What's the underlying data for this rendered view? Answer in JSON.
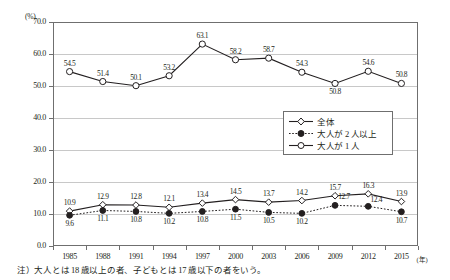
{
  "chart_data": {
    "type": "line",
    "title": "",
    "xlabel": "年",
    "ylabel": "(%)",
    "unit_label": "(%)",
    "xaxis_unit_label": "(年)",
    "ylim": [
      0.0,
      70.0
    ],
    "ytick_labels": [
      "0.0",
      "10.0",
      "20.0",
      "30.0",
      "40.0",
      "50.0",
      "60.0",
      "70.0"
    ],
    "ytick_values": [
      0.0,
      10.0,
      20.0,
      30.0,
      40.0,
      50.0,
      60.0,
      70.0
    ],
    "grid": true,
    "legend_position": "inside-right-middle",
    "categories": [
      "1985",
      "1988",
      "1991",
      "1994",
      "1997",
      "2000",
      "2003",
      "2006",
      "2009",
      "2012",
      "2015"
    ],
    "x": [
      1985,
      1988,
      1991,
      1994,
      1997,
      2000,
      2003,
      2006,
      2009,
      2012,
      2015
    ],
    "series": [
      {
        "name": "全体",
        "marker": "open-diamond",
        "linestyle": "solid",
        "values": [
          10.9,
          12.9,
          12.8,
          12.1,
          13.4,
          14.5,
          13.7,
          14.2,
          15.7,
          16.3,
          13.9
        ],
        "label_position": "above"
      },
      {
        "name": "大人が2人以上",
        "marker": "filled-circle",
        "linestyle": "dotted",
        "values": [
          9.6,
          11.1,
          10.8,
          10.2,
          10.8,
          11.5,
          10.5,
          10.2,
          12.7,
          12.4,
          10.7
        ],
        "label_position": "below"
      },
      {
        "name": "大人が1人",
        "marker": "open-circle",
        "linestyle": "solid",
        "values": [
          54.5,
          51.4,
          50.1,
          53.2,
          63.1,
          58.2,
          58.7,
          54.3,
          50.8,
          54.6,
          50.8
        ],
        "label_position": "above"
      }
    ],
    "annotations": []
  },
  "legend": {
    "items": [
      {
        "label": "全体",
        "marker": "open-diamond",
        "linestyle": "solid"
      },
      {
        "label": "大人が 2 人以上",
        "marker": "filled-circle",
        "linestyle": "dotted"
      },
      {
        "label": "大人が 1 人",
        "marker": "open-circle",
        "linestyle": "solid"
      }
    ]
  },
  "footnote": {
    "text": "注）大人とは 18 歳以上の者、子どもとは 17 歳以下の者をいう。"
  },
  "colors": {
    "line": "#231f20",
    "grid": "#c8c8c8",
    "frame": "#6f6f6f",
    "text": "#231f20",
    "marker_fill": "#ffffff"
  }
}
